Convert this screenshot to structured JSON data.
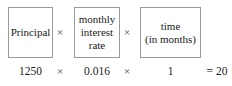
{
  "figure": {
    "type": "formula-diagram",
    "border_color": "#9a9a9a",
    "text_color": "#1a1a1a",
    "background_color": "#ffffff"
  },
  "boxes": [
    {
      "id": "principal",
      "lines": [
        "Principal"
      ]
    },
    {
      "id": "rate",
      "lines": [
        "monthly",
        "interest",
        "rate"
      ]
    },
    {
      "id": "time",
      "lines": [
        "time",
        "(in months)"
      ]
    }
  ],
  "operators": {
    "times": "×",
    "equals": "="
  },
  "values": {
    "principal": "1250",
    "rate": "0.016",
    "time": "1",
    "result": "20",
    "result_expression": "= 20"
  }
}
